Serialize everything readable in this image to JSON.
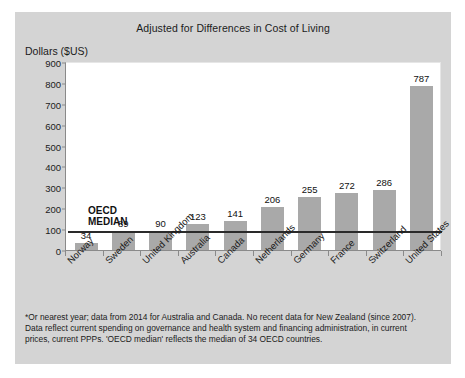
{
  "chart_data": {
    "type": "bar",
    "title": "Adjusted for Differences in Cost of Living",
    "ylabel": "Dollars ($US)",
    "xlabel": "",
    "ylim": [
      0,
      900
    ],
    "yticks": [
      900,
      800,
      700,
      600,
      500,
      400,
      300,
      200,
      100,
      0
    ],
    "grid": false,
    "legend": "none",
    "categories": [
      "Norway",
      "Sweden",
      "United Kingdom",
      "Australia",
      "Canada",
      "Netherlands",
      "Germany",
      "France",
      "Switzerland",
      "United States"
    ],
    "values": [
      34,
      89,
      90,
      123,
      141,
      206,
      255,
      272,
      286,
      787
    ],
    "bar_color": "#a9a9a9",
    "annotations": [
      {
        "name": "oecd-median-line",
        "label": "OECD\nMEDIAN",
        "value": 95,
        "color": "#2a2a2a"
      }
    ]
  },
  "footnote": {
    "line1": "*Or nearest year; data from 2014 for Australia and Canada. No recent data for New Zealand (since 2007).",
    "line2": "Data reflect current spending on governance and health system and financing administration, in current",
    "line3": "prices, current PPPs. 'OECD median' reflects the median of 34 OECD countries."
  }
}
